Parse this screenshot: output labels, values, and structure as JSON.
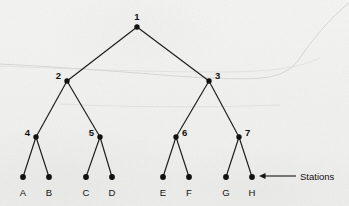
{
  "figure": {
    "background_color": "#f1f1ef",
    "ink_color": "#121212",
    "width": 349,
    "height": 206
  },
  "chart_data": {
    "type": "diagram",
    "diagram_type": "binary-tree",
    "title": "",
    "nodes": [
      {
        "id": "1",
        "label": "1",
        "x": 137,
        "y": 27,
        "level": 0,
        "label_dx": 0,
        "label_dy": -7,
        "label_anchor": "middle",
        "kind": "internal"
      },
      {
        "id": "2",
        "label": "2",
        "x": 67,
        "y": 81,
        "level": 1,
        "label_dx": -6,
        "label_dy": -2,
        "label_anchor": "end",
        "kind": "internal"
      },
      {
        "id": "3",
        "label": "3",
        "x": 209,
        "y": 81,
        "level": 1,
        "label_dx": 6,
        "label_dy": -2,
        "label_anchor": "start",
        "kind": "internal"
      },
      {
        "id": "4",
        "label": "4",
        "x": 36,
        "y": 137,
        "level": 2,
        "label_dx": -6,
        "label_dy": -1,
        "label_anchor": "end",
        "kind": "internal"
      },
      {
        "id": "5",
        "label": "5",
        "x": 100,
        "y": 137,
        "level": 2,
        "label_dx": -6,
        "label_dy": -1,
        "label_anchor": "end",
        "kind": "internal"
      },
      {
        "id": "6",
        "label": "6",
        "x": 176,
        "y": 137,
        "level": 2,
        "label_dx": 6,
        "label_dy": -1,
        "label_anchor": "start",
        "kind": "internal"
      },
      {
        "id": "7",
        "label": "7",
        "x": 239,
        "y": 137,
        "level": 2,
        "label_dx": 6,
        "label_dy": -1,
        "label_anchor": "start",
        "kind": "internal"
      },
      {
        "id": "A",
        "label": "A",
        "x": 23,
        "y": 177,
        "level": 3,
        "label_dx": 0,
        "label_dy": 19,
        "label_anchor": "middle",
        "kind": "station"
      },
      {
        "id": "B",
        "label": "B",
        "x": 49,
        "y": 177,
        "level": 3,
        "label_dx": 0,
        "label_dy": 19,
        "label_anchor": "middle",
        "kind": "station"
      },
      {
        "id": "C",
        "label": "C",
        "x": 86,
        "y": 177,
        "level": 3,
        "label_dx": 0,
        "label_dy": 19,
        "label_anchor": "middle",
        "kind": "station"
      },
      {
        "id": "D",
        "label": "D",
        "x": 112,
        "y": 177,
        "level": 3,
        "label_dx": 0,
        "label_dy": 19,
        "label_anchor": "middle",
        "kind": "station"
      },
      {
        "id": "E",
        "label": "E",
        "x": 163,
        "y": 177,
        "level": 3,
        "label_dx": 0,
        "label_dy": 19,
        "label_anchor": "middle",
        "kind": "station"
      },
      {
        "id": "F",
        "label": "F",
        "x": 189,
        "y": 177,
        "level": 3,
        "label_dx": 0,
        "label_dy": 19,
        "label_anchor": "middle",
        "kind": "station"
      },
      {
        "id": "G",
        "label": "G",
        "x": 226,
        "y": 177,
        "level": 3,
        "label_dx": 0,
        "label_dy": 19,
        "label_anchor": "middle",
        "kind": "station"
      },
      {
        "id": "H",
        "label": "H",
        "x": 252,
        "y": 177,
        "level": 3,
        "label_dx": 0,
        "label_dy": 19,
        "label_anchor": "middle",
        "kind": "station"
      }
    ],
    "edges": [
      {
        "from": "1",
        "to": "2"
      },
      {
        "from": "1",
        "to": "3"
      },
      {
        "from": "2",
        "to": "4"
      },
      {
        "from": "2",
        "to": "5"
      },
      {
        "from": "3",
        "to": "6"
      },
      {
        "from": "3",
        "to": "7"
      },
      {
        "from": "4",
        "to": "A"
      },
      {
        "from": "4",
        "to": "B"
      },
      {
        "from": "5",
        "to": "C"
      },
      {
        "from": "5",
        "to": "D"
      },
      {
        "from": "6",
        "to": "E"
      },
      {
        "from": "6",
        "to": "F"
      },
      {
        "from": "7",
        "to": "G"
      },
      {
        "from": "7",
        "to": "H"
      }
    ],
    "annotations": [
      {
        "id": "stations-callout",
        "text": "Stations",
        "target_node": "H",
        "arrow_from_x": 296,
        "arrow_from_y": 176,
        "arrow_to_x": 259,
        "arrow_to_y": 176,
        "text_x": 300,
        "text_y": 180
      }
    ],
    "node_radius": 2.7,
    "leaf_radius": 2.9
  }
}
